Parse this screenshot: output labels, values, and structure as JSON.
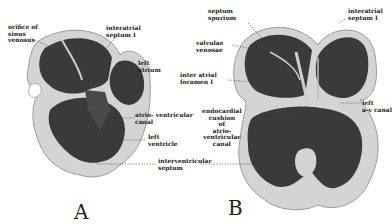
{
  "figures": [
    {
      "id": "A",
      "letter": "A",
      "labels": {
        "orifice": "orifice of\nsinus\nvenosus",
        "interatrial": "interatrial\nseptum I",
        "left_atrium": "left\natrium",
        "av_canal": "atrio- ventricular\ncanal",
        "left_ventricle": "left\nventricle",
        "interventricular": "interventricular\nseptum"
      }
    },
    {
      "id": "B",
      "letter": "B",
      "labels": {
        "septum_spurium": "septum\nspurium",
        "interatrial": "interatrial\nseptum I",
        "valvulae": "valvulae\nvenosae",
        "foramen": "inter atrial\nforamen I",
        "endocardial": "endocardial\ncushion\nof\natrio-\nventricular\ncanal",
        "left_av_canal": "left\na-v canal"
      }
    }
  ],
  "colors": {
    "wall": "#b8b8b8",
    "outer": "#d4d4d4",
    "chamber": "#3a3a3a",
    "text": "#1a1a1a"
  }
}
